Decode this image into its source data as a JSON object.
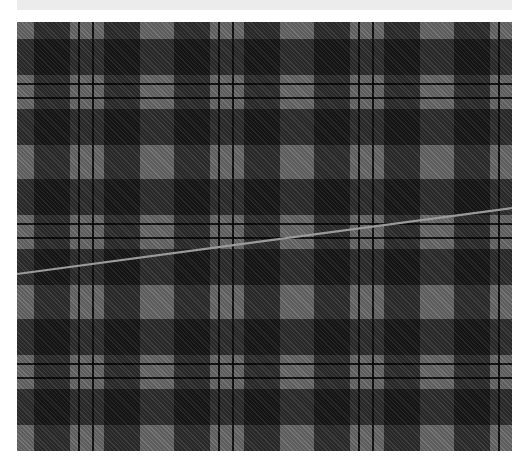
{
  "image": {
    "description": "Grey and black tartan plaid fabric swatch with a thin diagonal light grey line crossing it",
    "top_strip_text": "",
    "colors": {
      "background": "#ffffff",
      "top_strip": "#ececec",
      "ground_grey": "#6b6b6b",
      "dark_band": "#2a2a2a",
      "black_line": "#0a0a0a",
      "diagonal_line": "#9a9a9a"
    },
    "sett": {
      "period_px": 140,
      "stripes": [
        {
          "color": "grey",
          "start": 0,
          "end": 17
        },
        {
          "color": "dark",
          "start": 17,
          "end": 53
        },
        {
          "color": "grey",
          "start": 53,
          "end": 61
        },
        {
          "color": "black",
          "start": 61,
          "end": 63
        },
        {
          "color": "grey",
          "start": 63,
          "end": 75
        },
        {
          "color": "black",
          "start": 75,
          "end": 77
        },
        {
          "color": "grey",
          "start": 77,
          "end": 87
        },
        {
          "color": "dark",
          "start": 87,
          "end": 123
        },
        {
          "color": "grey",
          "start": 123,
          "end": 140
        }
      ]
    },
    "diagonal_line": {
      "x1": 17,
      "y1": 274,
      "x2": 512,
      "y2": 208
    }
  }
}
